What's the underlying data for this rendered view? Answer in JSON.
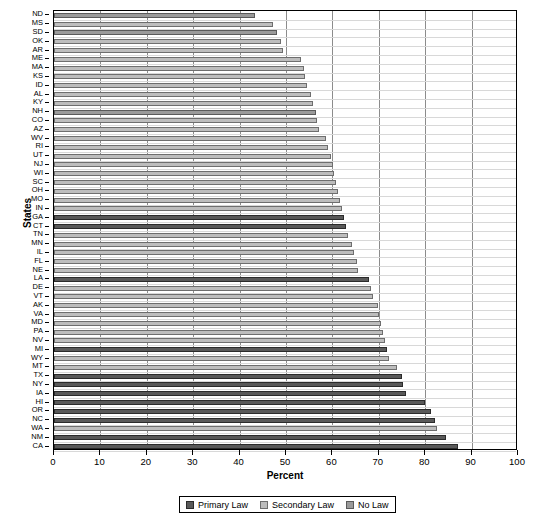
{
  "chart_data": {
    "type": "bar",
    "orientation": "horizontal",
    "title": "",
    "xlabel": "Percent",
    "ylabel": "States",
    "xlim": [
      0,
      100
    ],
    "xticks": [
      0,
      10,
      20,
      30,
      40,
      50,
      60,
      70,
      80,
      90,
      100
    ],
    "grid": "vertical",
    "legend_position": "bottom-center",
    "legend": [
      {
        "label": "Primary Law",
        "color": "#595959",
        "key": "primary"
      },
      {
        "label": "Secondary Law",
        "color": "#bdbdbd",
        "key": "secondary"
      },
      {
        "label": "No Law",
        "color": "#9a9a9a",
        "key": "nolaw"
      }
    ],
    "categories": [
      "ND",
      "MS",
      "SD",
      "OK",
      "AR",
      "ME",
      "MA",
      "KS",
      "ID",
      "AL",
      "KY",
      "NH",
      "CO",
      "AZ",
      "WV",
      "RI",
      "UT",
      "NJ",
      "WI",
      "SC",
      "OH",
      "MO",
      "IN",
      "GA",
      "CT",
      "TN",
      "MN",
      "IL",
      "FL",
      "NE",
      "LA",
      "DE",
      "VT",
      "AK",
      "VA",
      "MD",
      "PA",
      "NV",
      "MI",
      "WY",
      "MT",
      "TX",
      "NY",
      "IA",
      "HI",
      "OR",
      "NC",
      "WA",
      "NM",
      "CA"
    ],
    "bars": [
      {
        "state": "ND",
        "value": 43.4,
        "law": "nolaw"
      },
      {
        "state": "MS",
        "value": 47.2,
        "law": "secondary"
      },
      {
        "state": "SD",
        "value": 48.0,
        "law": "nolaw"
      },
      {
        "state": "OK",
        "value": 48.9,
        "law": "secondary"
      },
      {
        "state": "AR",
        "value": 49.3,
        "law": "secondary"
      },
      {
        "state": "ME",
        "value": 53.3,
        "law": "secondary"
      },
      {
        "state": "MA",
        "value": 53.9,
        "law": "secondary"
      },
      {
        "state": "KS",
        "value": 54.1,
        "law": "secondary"
      },
      {
        "state": "ID",
        "value": 54.6,
        "law": "secondary"
      },
      {
        "state": "AL",
        "value": 55.4,
        "law": "secondary"
      },
      {
        "state": "KY",
        "value": 55.8,
        "law": "secondary"
      },
      {
        "state": "NH",
        "value": 56.4,
        "law": "nolaw"
      },
      {
        "state": "CO",
        "value": 56.7,
        "law": "secondary"
      },
      {
        "state": "AZ",
        "value": 57.2,
        "law": "secondary"
      },
      {
        "state": "WV",
        "value": 58.6,
        "law": "secondary"
      },
      {
        "state": "RI",
        "value": 59.1,
        "law": "secondary"
      },
      {
        "state": "UT",
        "value": 59.6,
        "law": "secondary"
      },
      {
        "state": "NJ",
        "value": 60.1,
        "law": "secondary"
      },
      {
        "state": "WI",
        "value": 60.4,
        "law": "secondary"
      },
      {
        "state": "SC",
        "value": 60.8,
        "law": "secondary"
      },
      {
        "state": "OH",
        "value": 61.3,
        "law": "secondary"
      },
      {
        "state": "MO",
        "value": 61.6,
        "law": "secondary"
      },
      {
        "state": "IN",
        "value": 62.1,
        "law": "secondary"
      },
      {
        "state": "GA",
        "value": 62.5,
        "law": "primary"
      },
      {
        "state": "CT",
        "value": 63.0,
        "law": "primary"
      },
      {
        "state": "TN",
        "value": 63.4,
        "law": "secondary"
      },
      {
        "state": "MN",
        "value": 64.3,
        "law": "secondary"
      },
      {
        "state": "IL",
        "value": 64.7,
        "law": "secondary"
      },
      {
        "state": "FL",
        "value": 65.2,
        "law": "secondary"
      },
      {
        "state": "NE",
        "value": 65.6,
        "law": "secondary"
      },
      {
        "state": "LA",
        "value": 67.9,
        "law": "primary"
      },
      {
        "state": "DE",
        "value": 68.3,
        "law": "secondary"
      },
      {
        "state": "VT",
        "value": 68.8,
        "law": "secondary"
      },
      {
        "state": "AK",
        "value": 69.8,
        "law": "secondary"
      },
      {
        "state": "VA",
        "value": 70.1,
        "law": "secondary"
      },
      {
        "state": "MD",
        "value": 70.5,
        "law": "secondary"
      },
      {
        "state": "PA",
        "value": 71.0,
        "law": "secondary"
      },
      {
        "state": "NV",
        "value": 71.4,
        "law": "secondary"
      },
      {
        "state": "MI",
        "value": 71.8,
        "law": "primary"
      },
      {
        "state": "WY",
        "value": 72.2,
        "law": "secondary"
      },
      {
        "state": "MT",
        "value": 73.9,
        "law": "secondary"
      },
      {
        "state": "TX",
        "value": 75.0,
        "law": "primary"
      },
      {
        "state": "NY",
        "value": 75.3,
        "law": "primary"
      },
      {
        "state": "IA",
        "value": 75.8,
        "law": "primary"
      },
      {
        "state": "HI",
        "value": 80.0,
        "law": "primary"
      },
      {
        "state": "OR",
        "value": 81.2,
        "law": "primary"
      },
      {
        "state": "NC",
        "value": 82.1,
        "law": "primary"
      },
      {
        "state": "WA",
        "value": 82.6,
        "law": "secondary"
      },
      {
        "state": "NM",
        "value": 84.5,
        "law": "primary"
      },
      {
        "state": "CA",
        "value": 87.0,
        "law": "primary"
      }
    ]
  }
}
